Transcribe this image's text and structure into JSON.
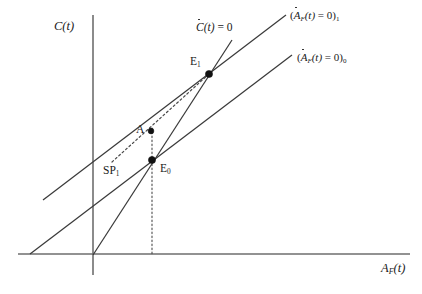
{
  "figure": {
    "type": "phase-diagram",
    "width": 422,
    "height": 294,
    "background": "#ffffff",
    "line_color": "#3a3a3a",
    "axis_color": "#6e6e6e",
    "marker_color": "#111111"
  },
  "axes": {
    "y_label": "C(t)",
    "y_label_parts": {
      "var": "C",
      "arg": "(t)"
    },
    "x_label": "A_F(t)",
    "x_label_parts": {
      "var": "A",
      "subscript": "F",
      "arg": "(t)"
    },
    "origin": {
      "x": 93,
      "y": 254
    }
  },
  "curves": [
    {
      "id": "c-dot-zero",
      "label": "Ċ(t) = 0",
      "label_parts": {
        "var": "C",
        "overdot": true,
        "arg": "(t)",
        "eq": " = 0",
        "subscript": ""
      },
      "kind": "steep-locus",
      "from": {
        "x": 93,
        "y": 255
      },
      "to": {
        "x": 232,
        "y": 40
      }
    },
    {
      "id": "a-dot-zero-1",
      "label": "(Ȧ_F(t) = 0)₁",
      "label_parts": {
        "open": "(",
        "var": "A",
        "overdot": true,
        "subscript": "F",
        "arg": "(t)",
        "eq": " = 0",
        "close": ")",
        "index": "1"
      },
      "kind": "upper-parallel-locus",
      "from": {
        "x": 43,
        "y": 200
      },
      "to": {
        "x": 286,
        "y": 15
      }
    },
    {
      "id": "a-dot-zero-0",
      "label": "(Ȧ_F(t) = 0)₀",
      "label_parts": {
        "open": "(",
        "var": "A",
        "overdot": true,
        "subscript": "F",
        "arg": "(t)",
        "eq": " = 0",
        "close": ")",
        "index": "0"
      },
      "kind": "lower-parallel-locus",
      "from": {
        "x": 30,
        "y": 254
      },
      "to": {
        "x": 292,
        "y": 55
      }
    },
    {
      "id": "saddle-path-1",
      "label": "SP₁",
      "label_parts": {
        "text": "SP",
        "index": "1"
      },
      "kind": "saddle-path",
      "dashed": true,
      "from": {
        "x": 112,
        "y": 161
      },
      "to": {
        "x": 209,
        "y": 74
      }
    }
  ],
  "points": [
    {
      "id": "E1",
      "label": "E",
      "index": "1",
      "x": 209,
      "y": 74,
      "label_pos": "upper-left"
    },
    {
      "id": "E0",
      "label": "E",
      "index": "0",
      "x": 152,
      "y": 160,
      "label_pos": "lower-right"
    },
    {
      "id": "A",
      "label": "A",
      "index": "",
      "x": 151,
      "y": 131,
      "label_pos": "left"
    }
  ],
  "guides": [
    {
      "id": "e0-drop",
      "kind": "vertical-dotted",
      "x": 152,
      "from_y": 160,
      "to_y": 254
    }
  ]
}
